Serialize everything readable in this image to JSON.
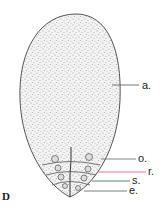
{
  "figure": {
    "panel_letter": "D",
    "labels": [
      {
        "id": "a",
        "text": "a.",
        "line_color": "#555555"
      },
      {
        "id": "o",
        "text": "o.",
        "line_color": "#6a6470"
      },
      {
        "id": "r",
        "text": "r.",
        "line_color": "#d9556a"
      },
      {
        "id": "s",
        "text": "s.",
        "line_color": "#2e6b5e"
      },
      {
        "id": "e",
        "text": "e.",
        "line_color": "#5a5a5a"
      }
    ]
  }
}
